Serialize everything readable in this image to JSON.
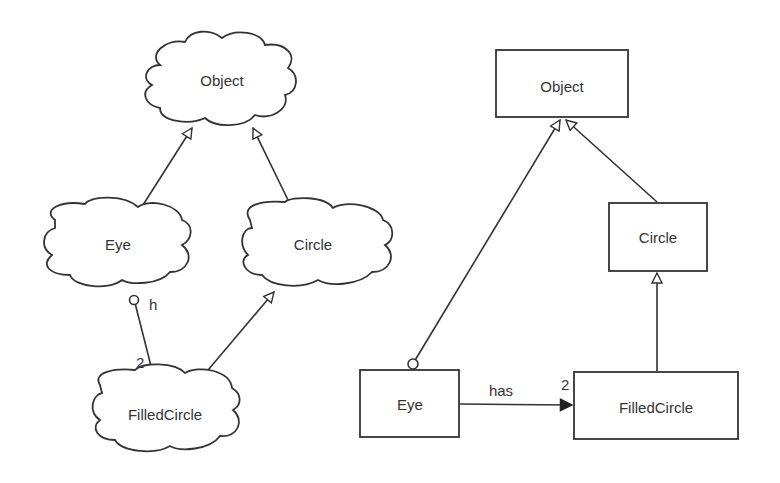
{
  "left_diagram": {
    "notation": "booch-clouds",
    "nodes": [
      {
        "id": "object",
        "label": "Object"
      },
      {
        "id": "eye",
        "label": "Eye"
      },
      {
        "id": "circle",
        "label": "Circle"
      },
      {
        "id": "filledcircle",
        "label": "FilledCircle"
      }
    ],
    "edges": [
      {
        "from": "eye",
        "to": "object",
        "type": "inheritance"
      },
      {
        "from": "circle",
        "to": "object",
        "type": "inheritance"
      },
      {
        "from": "filledcircle",
        "to": "circle",
        "type": "inheritance"
      },
      {
        "from": "eye",
        "to": "filledcircle",
        "type": "has",
        "role_label": "h",
        "multiplicity": "2"
      }
    ]
  },
  "right_diagram": {
    "notation": "uml-boxes",
    "nodes": [
      {
        "id": "object",
        "label": "Object"
      },
      {
        "id": "circle",
        "label": "Circle"
      },
      {
        "id": "eye",
        "label": "Eye"
      },
      {
        "id": "filledcircle",
        "label": "FilledCircle"
      }
    ],
    "edges": [
      {
        "from": "eye",
        "to": "object",
        "type": "inheritance"
      },
      {
        "from": "circle",
        "to": "object",
        "type": "inheritance"
      },
      {
        "from": "filledcircle",
        "to": "circle",
        "type": "inheritance"
      },
      {
        "from": "eye",
        "to": "filledcircle",
        "type": "association",
        "label": "has",
        "multiplicity": "2"
      }
    ]
  }
}
